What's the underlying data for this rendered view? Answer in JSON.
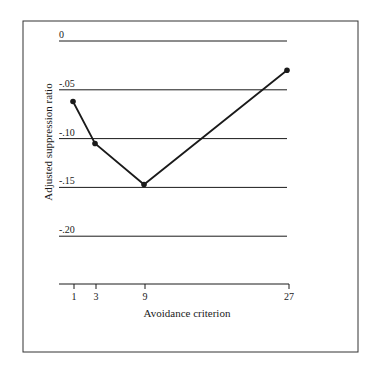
{
  "chart_data": {
    "type": "line",
    "title": "",
    "xlabel": "Avoidance criterion",
    "ylabel": "Adjusted suppression ratio",
    "x": [
      1,
      3,
      9,
      27
    ],
    "x_tick_labels": [
      "1",
      "3",
      "9",
      "27"
    ],
    "y_tick_labels": [
      "0",
      "-.05",
      "-.10",
      "-.15",
      "-.20"
    ],
    "y_ticks": [
      0,
      -0.05,
      -0.1,
      -0.15,
      -0.2
    ],
    "ylim": [
      -0.25,
      0
    ],
    "grid": true,
    "legend": null,
    "series": [
      {
        "name": "Adjusted suppression ratio",
        "values": [
          -0.062,
          -0.105,
          -0.147,
          -0.03
        ]
      }
    ]
  },
  "layout": {
    "frame": {
      "left": 23,
      "top": 21,
      "right": 358,
      "bottom": 352
    },
    "grid_left": 59,
    "grid_right": 287,
    "y_zero_px": 41,
    "px_per_005": 48.8,
    "x_axis_y": 284,
    "x_pixel_positions": [
      74,
      96,
      145,
      289
    ],
    "colors": {
      "ink": "#1a1a1a",
      "frame": "#333333",
      "background": "#ffffff"
    }
  }
}
